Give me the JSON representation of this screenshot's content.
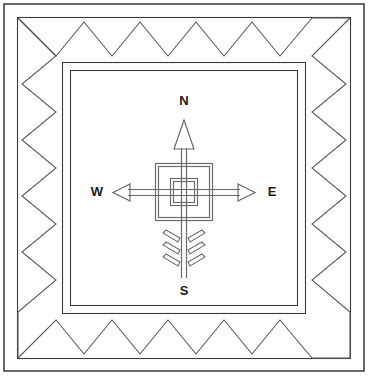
{
  "diagram": {
    "type": "line-drawing",
    "background_color": "#ffffff",
    "ink_color": "#3a3a3a",
    "labels": {
      "north": "N",
      "south": "S",
      "east": "E",
      "west": "W"
    },
    "label_positions": {
      "north": {
        "x": 184,
        "y": 102
      },
      "south": {
        "x": 184,
        "y": 292
      },
      "east": {
        "x": 272,
        "y": 193
      },
      "west": {
        "x": 97,
        "y": 193
      }
    },
    "border": {
      "outer_frame_color": "#2b2b2b",
      "inner_frame_color": "#3a3a3a",
      "zigzag_color": "#5a5a5a",
      "zigzag_teeth_horizontal": 9,
      "zigzag_teeth_vertical": 9
    },
    "compass": {
      "center": {
        "x": 184,
        "y": 192
      },
      "arrow_color": "#6a6a6a",
      "shaft_style": "double-line",
      "north_arrowhead": "hollow-triangle-tall",
      "east_arrowhead": "hollow-triangle-wide",
      "west_arrowhead": "hollow-triangle-wide",
      "fletching_pairs": 3,
      "nested_squares": 2
    }
  }
}
